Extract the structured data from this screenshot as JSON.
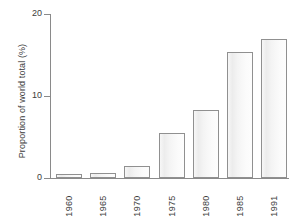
{
  "chart_data": {
    "type": "bar",
    "title": "",
    "xlabel": "",
    "ylabel": "Proportion of world total (%)",
    "categories": [
      "1960",
      "1965",
      "1970",
      "1975",
      "1980",
      "1985",
      "1991"
    ],
    "values": [
      0.5,
      0.6,
      1.5,
      5.5,
      8.3,
      15.4,
      16.9
    ],
    "ylim": [
      0,
      20
    ],
    "yticks": [
      0,
      10,
      20
    ],
    "ytick_labels": [
      "0",
      "10",
      "20"
    ],
    "grid": false,
    "legend": null,
    "bar_fill_color": "#f4f4f4",
    "bar_edge_color": "#909090",
    "axis_color": "#8a8a8a",
    "text_color": "#3c3c3c"
  }
}
